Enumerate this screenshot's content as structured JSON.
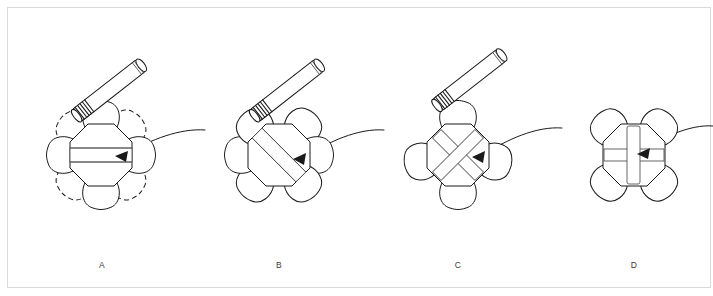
{
  "figure": {
    "width": 713,
    "height": 296,
    "background_color": "#ffffff",
    "frame": {
      "visible": true,
      "color": "#d9d9d9",
      "inset_px": 7
    },
    "line_color": "#1a1a1a",
    "accent_color": "#555555",
    "panels": [
      {
        "id": "A",
        "label": "A",
        "label_x": 102,
        "label_y": 266,
        "center_x": 101,
        "center_y": 155,
        "hub_radius": 31,
        "petal_count": 8,
        "petals_solid": [
          "north",
          "west",
          "east",
          "south"
        ],
        "petals_dashed": [
          "northeast",
          "northwest",
          "southeast",
          "southwest"
        ],
        "insert_type": "horizontal-bar",
        "insert_count": 1,
        "insert_angle_deg": 0,
        "pipette_visible": true,
        "pipette_angle_deg": -38,
        "incoming_arrow": true
      },
      {
        "id": "B",
        "label": "B",
        "label_x": 279,
        "label_y": 266,
        "center_x": 279,
        "center_y": 155,
        "hub_radius": 31,
        "petal_count": 6,
        "petals_solid": [
          "northwest",
          "northeast",
          "west",
          "east",
          "southwest",
          "southeast"
        ],
        "petals_dashed": [],
        "insert_type": "diagonal-bar",
        "insert_count": 1,
        "insert_angle_deg": 45,
        "pipette_visible": true,
        "pipette_angle_deg": -38,
        "incoming_arrow": true
      },
      {
        "id": "C",
        "label": "C",
        "label_x": 458,
        "label_y": 266,
        "center_x": 458,
        "center_y": 155,
        "hub_radius": 31,
        "petal_count": 4,
        "petals_solid": [
          "north",
          "west",
          "east",
          "south"
        ],
        "petals_dashed": [],
        "insert_type": "crossed-diagonal-bars",
        "insert_count": 2,
        "insert_angle_deg": 45,
        "pipette_visible": true,
        "pipette_angle_deg": -38,
        "incoming_arrow": true
      },
      {
        "id": "D",
        "label": "D",
        "label_x": 634,
        "label_y": 266,
        "center_x": 634,
        "center_y": 155,
        "hub_radius": 31,
        "petal_count": 4,
        "petals_solid": [
          "northwest",
          "northeast",
          "southwest",
          "southeast"
        ],
        "petals_dashed": [],
        "insert_type": "cross-plus-bars",
        "insert_count": 2,
        "insert_angle_deg": 0,
        "pipette_visible": false,
        "pipette_angle_deg": null,
        "incoming_arrow": true
      }
    ],
    "arrows": [
      {
        "id": "arrow-into-a",
        "from_panel": null,
        "to_panel": "A",
        "direction": "right-to-left",
        "style": "curved"
      },
      {
        "id": "arrow-into-b",
        "from_panel": "A",
        "to_panel": "B",
        "direction": "right-to-left",
        "style": "curved"
      },
      {
        "id": "arrow-into-c",
        "from_panel": "B",
        "to_panel": "C",
        "direction": "right-to-left",
        "style": "curved"
      },
      {
        "id": "arrow-into-d",
        "from_panel": "C",
        "to_panel": "D",
        "direction": "right-to-left",
        "style": "curved"
      }
    ],
    "pipette": {
      "name": "pipette-tool",
      "length": 84,
      "width": 15,
      "ring_count": 5,
      "tip_end": "lower-left",
      "cap_end": "upper-right"
    }
  }
}
